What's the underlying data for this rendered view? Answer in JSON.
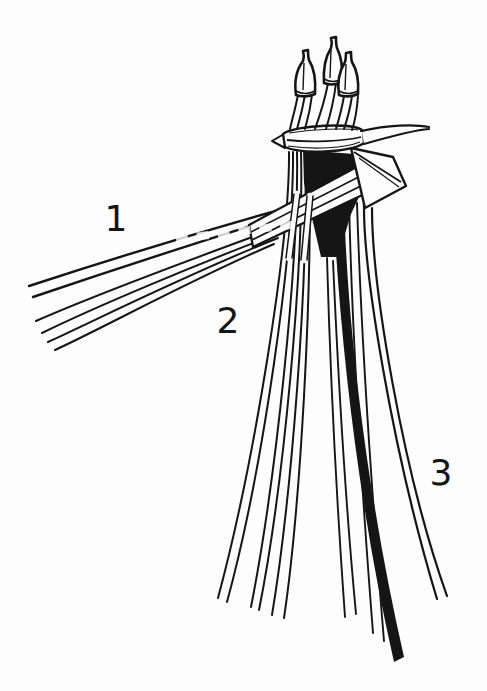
{
  "figure": {
    "paper_color": "#fdfdfd",
    "ink_color": "#151515",
    "labels": {
      "strand_group_1": "1",
      "strand_group_2": "2",
      "strand_group_3": "3"
    }
  }
}
